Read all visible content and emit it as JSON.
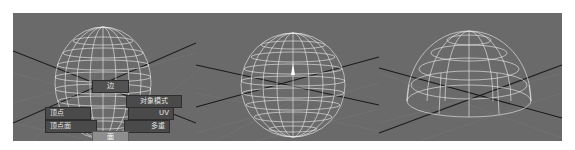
{
  "viewports": [
    {
      "id": "left",
      "object": "sphere",
      "marking_menu": {
        "items": [
          {
            "key": "edge",
            "label": "边",
            "position": "north"
          },
          {
            "key": "object_mode",
            "label": "对象模式",
            "position": "north-east"
          },
          {
            "key": "vertex",
            "label": "顶点",
            "position": "west"
          },
          {
            "key": "uv",
            "label": "UV",
            "position": "east"
          },
          {
            "key": "vertex_face",
            "label": "顶点面",
            "position": "south-west"
          },
          {
            "key": "multi",
            "label": "多重",
            "position": "south-east"
          },
          {
            "key": "face",
            "label": "面",
            "position": "south",
            "highlighted": true
          }
        ]
      }
    },
    {
      "id": "middle",
      "object": "sphere",
      "manipulator": "pivot"
    },
    {
      "id": "right",
      "object": "hemisphere"
    }
  ],
  "colors": {
    "viewport_bg": "#6a6a6a",
    "grid_line": "#7c7c7c",
    "axis_line": "#1a1a1a",
    "wireframe": "#f0f0f0",
    "menu_bg": "#4a4a4a",
    "menu_highlight": "#8e8e8e"
  }
}
